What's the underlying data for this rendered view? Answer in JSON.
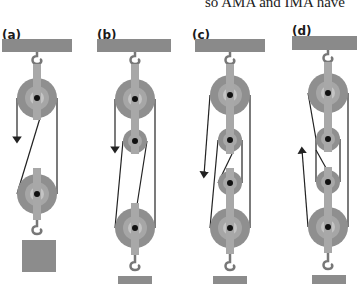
{
  "header": {
    "partial_text": "so AMA and IMA have"
  },
  "panels": [
    {
      "label": "(a)",
      "movable_pulleys": 1,
      "fixed_pulleys": 1,
      "effort_direction": "down"
    },
    {
      "label": "(b)",
      "movable_pulleys": 1,
      "fixed_pulleys": 2,
      "effort_direction": "down"
    },
    {
      "label": "(c)",
      "movable_pulleys": 2,
      "fixed_pulleys": 2,
      "effort_direction": "down"
    },
    {
      "label": "(d)",
      "movable_pulleys": 2,
      "fixed_pulleys": 2,
      "effort_direction": "up"
    }
  ],
  "colors": {
    "ceiling": "#8a8a8a",
    "pulley_outer": "#8f8f8f",
    "pulley_inner": "#b3b3b3",
    "pulley_hub": "#c8c8c8",
    "strap": "#a8a8a8",
    "axle": "#111111",
    "rope": "#222222",
    "weight": "#8c8c8c",
    "hook": "#777777"
  }
}
